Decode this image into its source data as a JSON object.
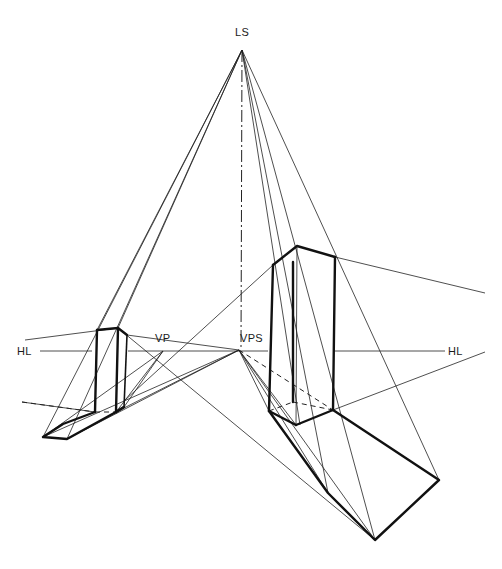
{
  "diagram": {
    "title": "",
    "labels": {
      "ls": "LS",
      "vp": "VP",
      "vps": "VPS",
      "hl_left": "HL",
      "hl_right": "HL"
    },
    "label_positions": {
      "ls": [
        235,
        27
      ],
      "vp": [
        155,
        333
      ],
      "vps": [
        240,
        333
      ],
      "hl_left": [
        17,
        346
      ],
      "hl_right": [
        448,
        346
      ]
    },
    "points": {
      "LS": [
        242,
        50
      ],
      "VP": [
        163,
        351
      ],
      "VPS": [
        239,
        350
      ]
    },
    "horizon_line": {
      "y": 351,
      "segments": [
        [
          40,
          92
        ],
        [
          128,
          268
        ],
        [
          334,
          445
        ]
      ]
    },
    "vertical_axis": {
      "from": [
        242,
        50
      ],
      "to": [
        241,
        350
      ],
      "style": "dash-dot"
    },
    "left_prism": {
      "top": [
        [
          97,
          330
        ],
        [
          118,
          328
        ],
        [
          127,
          335
        ]
      ],
      "bottom": [
        [
          95,
          412
        ],
        [
          116,
          412
        ],
        [
          124,
          407
        ]
      ],
      "hidden_edge": [
        [
          95,
          412
        ],
        [
          124,
          401
        ]
      ]
    },
    "left_shadow": {
      "outline": [
        [
          95,
          412
        ],
        [
          63,
          424
        ],
        [
          43,
          437
        ],
        [
          67,
          439
        ],
        [
          116,
          412
        ]
      ],
      "edge_back": [
        [
          124,
          407
        ],
        [
          116,
          412
        ]
      ]
    },
    "tall_prism": {
      "top": [
        [
          273,
          265
        ],
        [
          297,
          246
        ],
        [
          335,
          257
        ]
      ],
      "bottom": [
        [
          269,
          411
        ],
        [
          296,
          425
        ],
        [
          333,
          410
        ]
      ],
      "hidden_edges": [
        [
          [
            269,
            411
          ],
          [
            293,
            402
          ]
        ],
        [
          [
            293,
            402
          ],
          [
            333,
            410
          ]
        ]
      ],
      "inner_edge": [
        [
          293,
          262
        ],
        [
          293,
          402
        ]
      ]
    },
    "tall_shadow": {
      "outline": [
        [
          269,
          411
        ],
        [
          328,
          493
        ],
        [
          375,
          540
        ],
        [
          439,
          480
        ],
        [
          333,
          410
        ]
      ],
      "edge": [
        [
          296,
          425
        ],
        [
          269,
          411
        ]
      ]
    },
    "construction_lines": [
      [
        [
          242,
          50
        ],
        [
          43,
          437
        ]
      ],
      [
        [
          242,
          50
        ],
        [
          67,
          439
        ]
      ],
      [
        [
          242,
          50
        ],
        [
          328,
          493
        ]
      ],
      [
        [
          242,
          50
        ],
        [
          375,
          540
        ]
      ],
      [
        [
          242,
          50
        ],
        [
          439,
          480
        ]
      ],
      [
        [
          242,
          50
        ],
        [
          300,
          425
        ]
      ],
      [
        [
          25,
          340
        ],
        [
          118,
          328
        ]
      ],
      [
        [
          127,
          335
        ],
        [
          239,
          350
        ]
      ],
      [
        [
          335,
          257
        ],
        [
          485,
          293
        ]
      ],
      [
        [
          118,
          328
        ],
        [
          375,
          540
        ]
      ],
      [
        [
          239,
          350
        ],
        [
          43,
          437
        ]
      ],
      [
        [
          239,
          350
        ],
        [
          116,
          412
        ]
      ],
      [
        [
          239,
          350
        ],
        [
          67,
          439
        ]
      ],
      [
        [
          239,
          350
        ],
        [
          328,
          493
        ]
      ],
      [
        [
          239,
          350
        ],
        [
          375,
          540
        ]
      ],
      [
        [
          239,
          350
        ],
        [
          296,
          425
        ]
      ],
      [
        [
          239,
          350
        ],
        [
          269,
          411
        ]
      ],
      [
        [
          163,
          351
        ],
        [
          43,
          437
        ]
      ],
      [
        [
          163,
          351
        ],
        [
          124,
          407
        ]
      ],
      [
        [
          163,
          351
        ],
        [
          116,
          412
        ]
      ],
      [
        [
          273,
          265
        ],
        [
          124,
          401
        ]
      ],
      [
        [
          333,
          410
        ],
        [
          485,
          352
        ]
      ],
      [
        [
          22,
          402
        ],
        [
          95,
          412
        ]
      ],
      [
        [
          242,
          50
        ],
        [
          118,
          328
        ]
      ],
      [
        [
          242,
          50
        ],
        [
          97,
          330
        ]
      ]
    ],
    "dashed_lines": [
      [
        [
          239,
          350
        ],
        [
          333,
          410
        ]
      ],
      [
        [
          22,
          402
        ],
        [
          95,
          412
        ]
      ]
    ]
  }
}
